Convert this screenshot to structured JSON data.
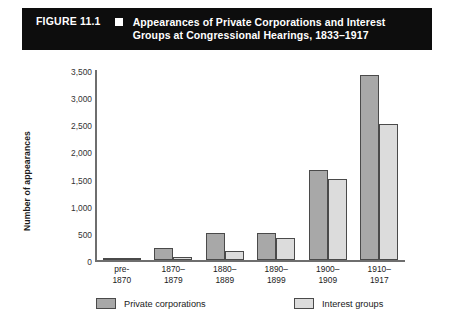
{
  "banner": {
    "figure_number": "FIGURE 11.1",
    "bullet_icon": "square-bullet-icon",
    "title_line1": "Appearances of Private Corporations and Interest",
    "title_line2": "Groups at Congressional Hearings, 1833–1917"
  },
  "colors": {
    "banner_bg": "#0d0d0d",
    "private_corporations": "#a8a8a8",
    "interest_groups": "#dcdcdc",
    "bar_outline": "#4a4a4a",
    "axis": "#6e6e6e"
  },
  "chart_data": {
    "type": "bar",
    "title": "Appearances of Private Corporations and Interest Groups at Congressional Hearings, 1833–1917",
    "xlabel": "",
    "ylabel": "Number of appearances",
    "categories": [
      "pre-1870",
      "1870–1879",
      "1880–1889",
      "1890–1899",
      "1900–1909",
      "1910–1917"
    ],
    "category_lines": [
      [
        "pre-",
        "1870"
      ],
      [
        "1870–",
        "1879"
      ],
      [
        "1880–",
        "1889"
      ],
      [
        "1890–",
        "1899"
      ],
      [
        "1900–",
        "1909"
      ],
      [
        "1910–",
        "1917"
      ]
    ],
    "series": [
      {
        "name": "Private corporations",
        "color": "#a8a8a8",
        "values": [
          20,
          230,
          500,
          500,
          1650,
          3400
        ]
      },
      {
        "name": "Interest groups",
        "color": "#dcdcdc",
        "values": [
          10,
          60,
          170,
          400,
          1500,
          2500
        ]
      }
    ],
    "ylim": [
      0,
      3500
    ],
    "yticks": [
      0,
      500,
      1000,
      1500,
      2000,
      2500,
      3000,
      3500
    ],
    "ytick_labels": [
      "0",
      "500",
      "1,000",
      "1,500",
      "2,000",
      "2,500",
      "3,000",
      "3,500"
    ],
    "grid": false,
    "legend_position": "bottom"
  }
}
